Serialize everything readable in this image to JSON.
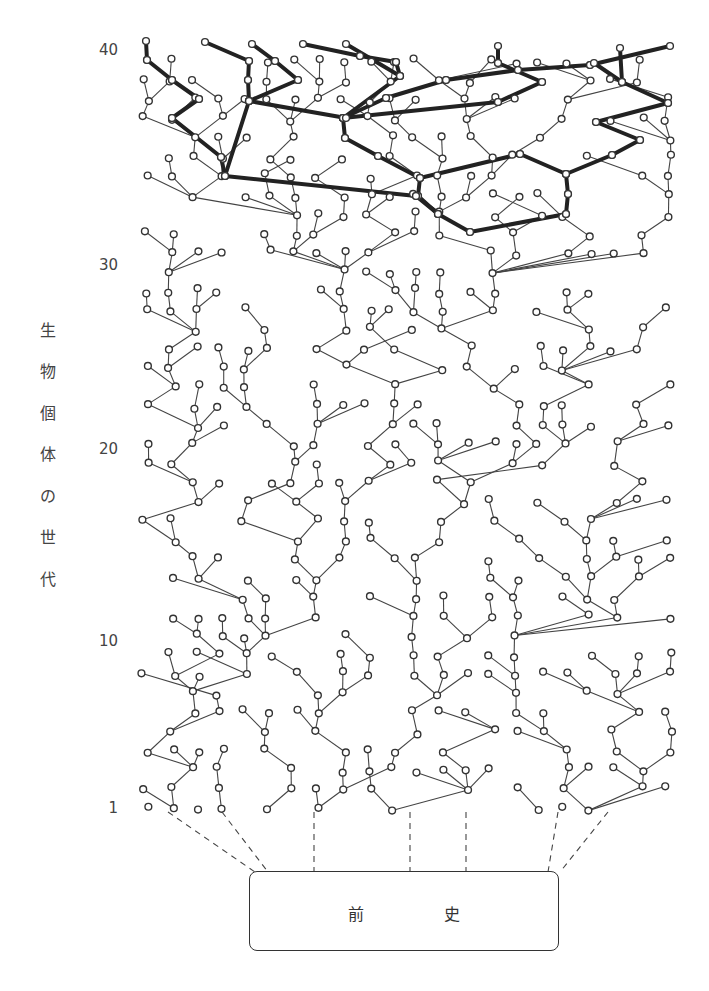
{
  "diagram": {
    "type": "genealogy-tree",
    "y_axis": {
      "label": "生物個体の世代",
      "label_chars": [
        "生",
        "物",
        "個",
        "体",
        "の",
        "世",
        "代"
      ],
      "ticks": [
        {
          "label": "40",
          "y": 50
        },
        {
          "label": "30",
          "y": 265
        },
        {
          "label": "20",
          "y": 449
        },
        {
          "label": "10",
          "y": 641
        },
        {
          "label": "1",
          "y": 808
        }
      ]
    },
    "prehistory": {
      "label_left": "前",
      "label_right": "史"
    },
    "colors": {
      "line": "#444444",
      "highlight": "#222222",
      "node_fill": "#ffffff",
      "node_stroke": "#333333"
    },
    "highlighted_lineage": "bold path from generation ~32 upward branching to generation 41"
  }
}
